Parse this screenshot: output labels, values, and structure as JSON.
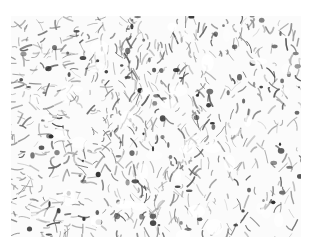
{
  "image": {
    "subject": "grayscale histology micrograph - dense fibrous tissue texture with dark stained cells",
    "palette": {
      "background": "#ffffff",
      "fiber": "#6e6e6e",
      "cell": "#2f2f2f",
      "light": "#bdbdbd"
    },
    "region": {
      "x": 11,
      "y": 16,
      "width": 290,
      "height": 221
    },
    "texture": {
      "seed": 7,
      "fibers": 900,
      "cells": 110
    }
  }
}
